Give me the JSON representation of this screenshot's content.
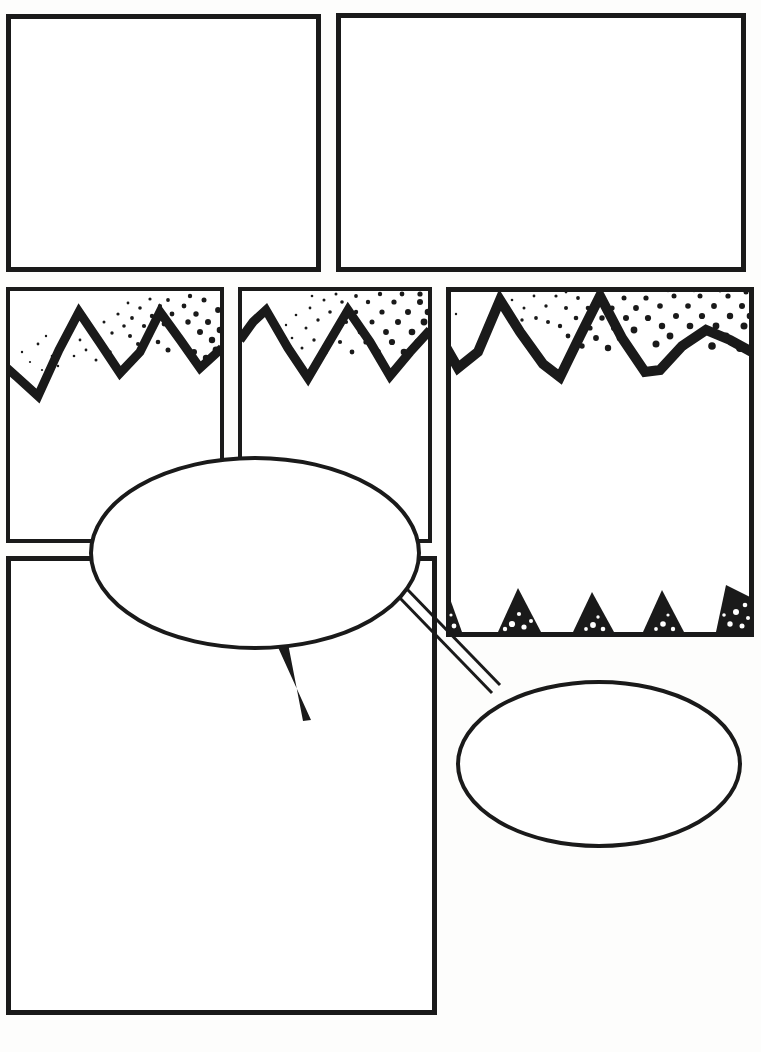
{
  "page": {
    "width": 761,
    "height": 1052,
    "background_color": "#fdfdfc",
    "ink_color": "#1a1a1a",
    "paper_color": "#ffffff",
    "panel_count": 6,
    "bubble_count": 2,
    "style": "blank comic book page with inked panel borders, halftone mountain ranges and empty speech balloons"
  },
  "panels": [
    {
      "id": "panel-1",
      "name": "top-left-panel",
      "row": 1,
      "order": 1,
      "x": 6,
      "y": 14,
      "w": 315,
      "h": 258,
      "border_width": 5,
      "content": "empty",
      "artwork": []
    },
    {
      "id": "panel-2",
      "name": "top-right-panel",
      "row": 1,
      "order": 2,
      "x": 336,
      "y": 13,
      "w": 410,
      "h": 259,
      "border_width": 5,
      "content": "empty",
      "artwork": []
    },
    {
      "id": "panel-3",
      "name": "middle-left-panel",
      "row": 2,
      "order": 3,
      "x": 6,
      "y": 287,
      "w": 218,
      "h": 256,
      "border_width": 4,
      "content": "mountain-range",
      "artwork": [
        "top-zigzag-mountains",
        "halftone-sky"
      ]
    },
    {
      "id": "panel-4",
      "name": "middle-center-panel",
      "row": 2,
      "order": 4,
      "x": 238,
      "y": 287,
      "w": 194,
      "h": 256,
      "border_width": 4,
      "content": "mountain-range",
      "artwork": [
        "top-zigzag-mountains",
        "halftone-sky"
      ]
    },
    {
      "id": "panel-5",
      "name": "middle-right-tall-panel",
      "row": 2,
      "order": 5,
      "x": 446,
      "y": 287,
      "w": 308,
      "h": 350,
      "border_width": 5,
      "content": "mountain-range-with-spikes",
      "artwork": [
        "top-zigzag-mountains",
        "halftone-sky",
        "bottom-spike-teeth",
        "spike-halftone"
      ]
    },
    {
      "id": "panel-6",
      "name": "bottom-left-large-panel",
      "row": 3,
      "order": 6,
      "x": 6,
      "y": 556,
      "w": 431,
      "h": 459,
      "border_width": 5,
      "content": "empty",
      "artwork": []
    }
  ],
  "bubbles": [
    {
      "id": "bubble-1",
      "name": "main-speech-balloon",
      "type": "speech",
      "cx": 255,
      "cy": 553,
      "rx": 164,
      "ry": 95,
      "stroke_width": 4,
      "text": "",
      "tail": {
        "type": "pointed-tail",
        "direction": "down",
        "points": "277,645 311,719 290,641"
      }
    },
    {
      "id": "bubble-2",
      "name": "linked-speech-balloon",
      "type": "speech",
      "cx": 599,
      "cy": 764,
      "rx": 141,
      "ry": 82,
      "stroke_width": 4,
      "text": "",
      "tail": {
        "type": "double-line-connector",
        "direction": "up-left",
        "points": "398,597 487,691"
      }
    }
  ],
  "connectors": [
    {
      "id": "connector-1",
      "name": "balloon-link-tube",
      "from": "bubble-1",
      "to": "bubble-2",
      "style": "parallel-double-line"
    }
  ],
  "artwork": {
    "mountains": {
      "stroke_width": 9,
      "description": "jagged peaked ridge line drawn as a thick zigzag"
    },
    "halftone": {
      "description": "graduated benday dot field above the ridge, dots grow larger toward the right",
      "min_dot_radius": 1,
      "max_dot_radius": 4.5
    },
    "spikes": {
      "description": "solid black triangular teeth along the lower edge with reversed white dots"
    }
  }
}
